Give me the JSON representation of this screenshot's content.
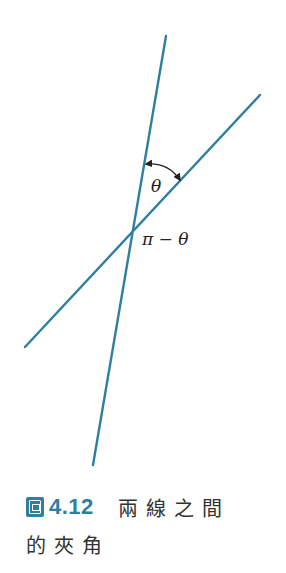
{
  "diagram": {
    "line_color": "#2e7fa0",
    "labels": {
      "theta": "θ",
      "pi_minus_theta": "π − θ"
    },
    "lines": [
      {
        "name": "steep-line",
        "x1": 166,
        "y1": 36,
        "x2": 93,
        "y2": 465
      },
      {
        "name": "shallow-line",
        "x1": 260,
        "y1": 95,
        "x2": 25,
        "y2": 347
      }
    ],
    "intersection": {
      "x": 133,
      "y": 229
    }
  },
  "caption": {
    "figure_label": "圖",
    "figure_number": "4.12",
    "title_part1": "兩線之間",
    "title_part2": "的夾角"
  }
}
